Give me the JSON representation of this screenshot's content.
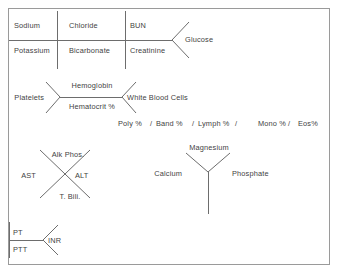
{
  "diagram": {
    "line_color": "#6d6d6d",
    "border_color": "#9a9a9a",
    "text_color": "#3f3f3f",
    "background": "#ffffff"
  },
  "chemistry_panel": {
    "name": "basic-metabolic-panel-fishbone",
    "top_row": [
      "Sodium",
      "Chloride",
      "BUN"
    ],
    "bottom_row": [
      "Potassium",
      "Bicarbonate",
      "Creatinine"
    ],
    "tip": "Glucose",
    "cells": {
      "sodium": "Sodium",
      "chloride": "Chloride",
      "bun": "BUN",
      "potassium": "Potassium",
      "bicarbonate": "Bicarbonate",
      "creatinine": "Creatinine",
      "glucose": "Glucose"
    }
  },
  "cbc_panel": {
    "name": "complete-blood-count-fishbone",
    "left": "Platelets",
    "top": "Hemoglobin",
    "bottom": "Hematocrit %",
    "right": "White Blood Cells",
    "differential": {
      "poly": "Poly %",
      "sep1": "/",
      "band": "Band %",
      "sep2": "/",
      "lymph": "Lymph %",
      "sep3": "/",
      "mono": "Mono %",
      "sep4": "/",
      "eos": "Eos%"
    }
  },
  "lft_panel": {
    "name": "liver-function-tests-x",
    "top": "Alk Phos.",
    "left": "AST",
    "right": "ALT",
    "bottom": "T. Bili."
  },
  "mineral_panel": {
    "name": "calcium-magnesium-phosphate-y",
    "top": "Magnesium",
    "left": "Calcium",
    "right": "Phosphate"
  },
  "coag_panel": {
    "name": "coagulation-fishbone",
    "top": "PT",
    "bottom": "PTT",
    "tip": "INR"
  }
}
